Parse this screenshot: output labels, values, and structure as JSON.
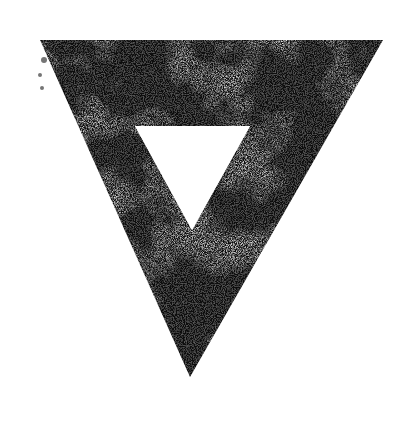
{
  "image": {
    "subject": "inverted triangle outline stamp",
    "description": "Grungy ink-stamped inverted triangle frame with a hollow triangular center on a white background",
    "width": 413,
    "height": 421
  },
  "colors": {
    "background": "#ffffff",
    "ink": "#0d0d0d",
    "ink_mid": "#2a2a2a",
    "hole": "#ffffff"
  },
  "shapes": {
    "outer_triangle": {
      "points": "40,40 383,40 190,377",
      "fuzzy_corner": "40,38 40,95"
    },
    "inner_triangle": {
      "points": "135,126 250,126 192,230"
    }
  }
}
